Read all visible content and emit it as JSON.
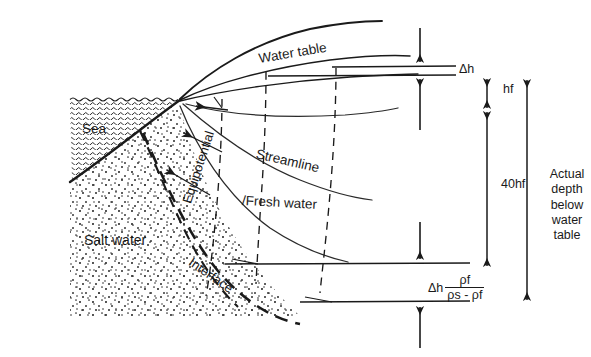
{
  "figure": {
    "type": "cross-section-diagram",
    "background_color": "#ffffff",
    "ink_color": "#1a1a1a"
  },
  "regions": {
    "sea": {
      "label": "Sea",
      "texture": "wavy-hatch"
    },
    "salt_water": {
      "label": "Salt water",
      "texture": "stipple-dots"
    },
    "fresh_water": {
      "label": "/Fresh water"
    }
  },
  "curves": {
    "water_table": {
      "label": "Water table",
      "style": "solid"
    },
    "streamline": {
      "label": "Streamline",
      "style": "solid"
    },
    "equipotential": {
      "label": "Equipotential",
      "style": "dashed"
    },
    "interface": {
      "label": "Interface",
      "style": "dashed-heavy"
    }
  },
  "dimensions": [
    {
      "name": "delta-h",
      "label": "Δh"
    },
    {
      "name": "hf",
      "label": "hf"
    },
    {
      "name": "forty-hf",
      "label": "40hf"
    },
    {
      "name": "actual-depth",
      "label": "Actual\ndepth\nbelow\nwater\ntable",
      "lines": [
        "Actual",
        "depth",
        "below",
        "water",
        "table"
      ]
    }
  ],
  "formula": {
    "name": "ghyben-herzberg-depth",
    "lead": "Δh",
    "numerator": "ρf",
    "denominator": "ρs - ρf"
  }
}
